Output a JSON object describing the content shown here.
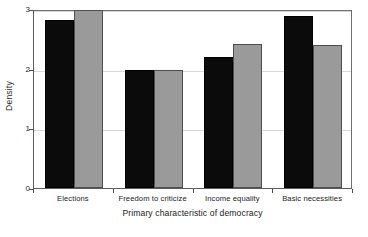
{
  "chart_data": {
    "type": "bar",
    "title": "",
    "xlabel": "Primary characteristic of democracy",
    "ylabel": "Density",
    "categories": [
      "Elections",
      "Freedom to criticize",
      "Income equality",
      "Basic necessities"
    ],
    "series": [
      {
        "name": "series-1",
        "color": "#0b0b0b",
        "values": [
          2.81,
          1.97,
          2.19,
          2.88
        ]
      },
      {
        "name": "series-2",
        "color": "#9a9a9a",
        "values": [
          2.98,
          1.97,
          2.41,
          2.4
        ]
      }
    ],
    "ylim": [
      0,
      3
    ],
    "yticks": [
      0,
      1,
      2,
      3
    ],
    "ytick_labels": [
      "0",
      "1",
      "2",
      "3"
    ],
    "grid": true,
    "grid_axis": "y",
    "legend": "none",
    "xlim": [
      0,
      4
    ]
  }
}
